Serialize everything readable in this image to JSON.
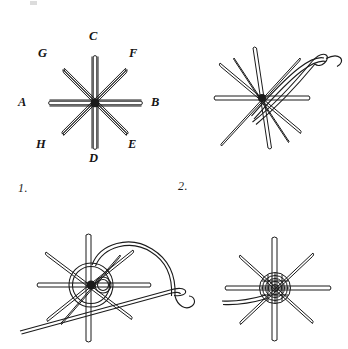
{
  "plate": {
    "title": "Woven Spider Web Wheel Stitch - four step diagram",
    "background_color": "#ffffff",
    "ink_color": "#1b1b1b",
    "width": 348,
    "height": 349
  },
  "figures": [
    {
      "number": "1.",
      "name": "foundation-spokes",
      "caption_x": 18,
      "caption_y": 181,
      "center_x": 95,
      "center_y": 103,
      "spoke_count": 8,
      "spoke_length": 48,
      "description": "Eight straight foundation spokes radiating from a common centre, each end lettered."
    },
    {
      "number": "2.",
      "name": "needle-entering-centre",
      "caption_x": 178,
      "caption_y": 181,
      "center_x": 262,
      "center_y": 98,
      "spoke_count": 8,
      "spoke_length": 48,
      "description": "Threaded needle brought up beside the centre ready to begin weaving."
    },
    {
      "number": "3.",
      "name": "weaving-back-stitch",
      "caption_x": null,
      "caption_y": null,
      "center_x": 95,
      "center_y": 285,
      "spoke_count": 8,
      "spoke_length": 55,
      "description": "Needle passing back under two spokes and forward over one, thread looping round the hub."
    },
    {
      "number": "4.",
      "name": "completed-wheel",
      "caption_x": null,
      "caption_y": null,
      "center_x": 277,
      "center_y": 288,
      "spoke_count": 8,
      "spoke_length": 52,
      "description": "Centre filled with tightly packed woven rounds; two thread tails left at the side."
    }
  ],
  "point_labels": [
    {
      "letter": "A",
      "x": 18,
      "y": 96,
      "spoke": "west"
    },
    {
      "letter": "B",
      "x": 151,
      "y": 96,
      "spoke": "east"
    },
    {
      "letter": "C",
      "x": 89,
      "y": 30,
      "spoke": "north"
    },
    {
      "letter": "D",
      "x": 89,
      "y": 154,
      "spoke": "south"
    },
    {
      "letter": "E",
      "x": 127,
      "y": 140,
      "spoke": "southeast"
    },
    {
      "letter": "F",
      "x": 129,
      "y": 49,
      "spoke": "northeast"
    },
    {
      "letter": "G",
      "x": 38,
      "y": 49,
      "spoke": "northwest"
    },
    {
      "letter": "H",
      "x": 36,
      "y": 140,
      "spoke": "southwest"
    }
  ]
}
